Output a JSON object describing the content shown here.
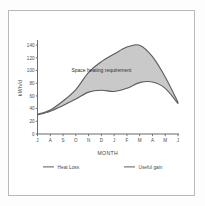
{
  "figure": {
    "background_color": "#ffffff",
    "border_color": "#b9b9b9"
  },
  "chart_data": {
    "type": "area",
    "title": "",
    "subtitle": "",
    "xlabel": "MONTH",
    "ylabel": "kWh/d",
    "categories": [
      "J",
      "A",
      "S",
      "O",
      "N",
      "D",
      "J",
      "F",
      "M",
      "A",
      "M",
      "J"
    ],
    "xtick_labels": [
      "J",
      "A",
      "S",
      "O",
      "N",
      "D",
      "J",
      "F",
      "M",
      "A",
      "M",
      "J"
    ],
    "ytick_labels": [
      "0",
      "20",
      "40",
      "60",
      "80",
      "100",
      "120",
      "140"
    ],
    "ytick_values": [
      0,
      20,
      40,
      60,
      80,
      100,
      120,
      140
    ],
    "ylim": [
      0,
      145
    ],
    "xlim": [
      0,
      11
    ],
    "grid": false,
    "legend_position": "bottom",
    "fill_between_color": "#c9c9c9",
    "line_color": "#5b5b5b",
    "series": [
      {
        "name": "Heat Loss",
        "values": [
          31,
          38,
          52,
          70,
          97,
          114,
          126,
          137,
          140,
          122,
          90,
          50
        ]
      },
      {
        "name": "Useful gain",
        "values": [
          30,
          36,
          45,
          55,
          66,
          69,
          67,
          72,
          81,
          82,
          72,
          48
        ]
      }
    ],
    "annotations": [
      {
        "text": "Space heating requirement",
        "x": 5.0,
        "y": 100
      }
    ]
  },
  "legend": {
    "items": [
      {
        "label": "Heat Loss",
        "color": "#5b5b5b"
      },
      {
        "label": "Useful gain",
        "color": "#5b5b5b"
      }
    ]
  }
}
